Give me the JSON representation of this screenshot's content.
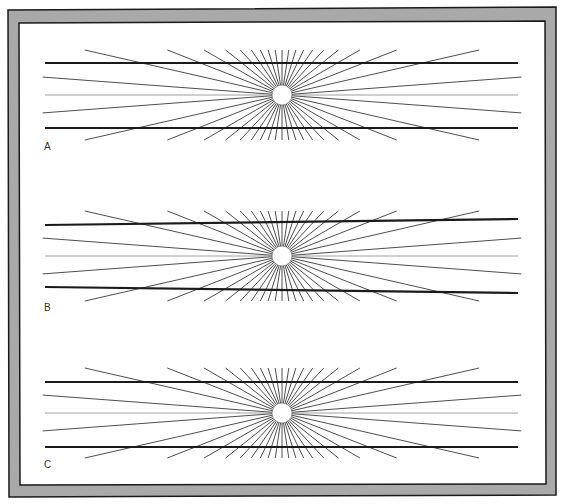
{
  "figure": {
    "title": "",
    "frame_color": "#a9a9a9",
    "frame_outline": "#1a1a1a",
    "line_color": "#1a1a1a",
    "ray_color": "#3a3a3a",
    "panels": [
      {
        "label": "A",
        "top_line_tilt": 0,
        "bottom_line_tilt": 0
      },
      {
        "label": "B",
        "top_line_tilt": 1,
        "bottom_line_tilt": -1
      },
      {
        "label": "C",
        "top_line_tilt": 0,
        "bottom_line_tilt": 0
      }
    ],
    "rays_per_half": 21
  }
}
